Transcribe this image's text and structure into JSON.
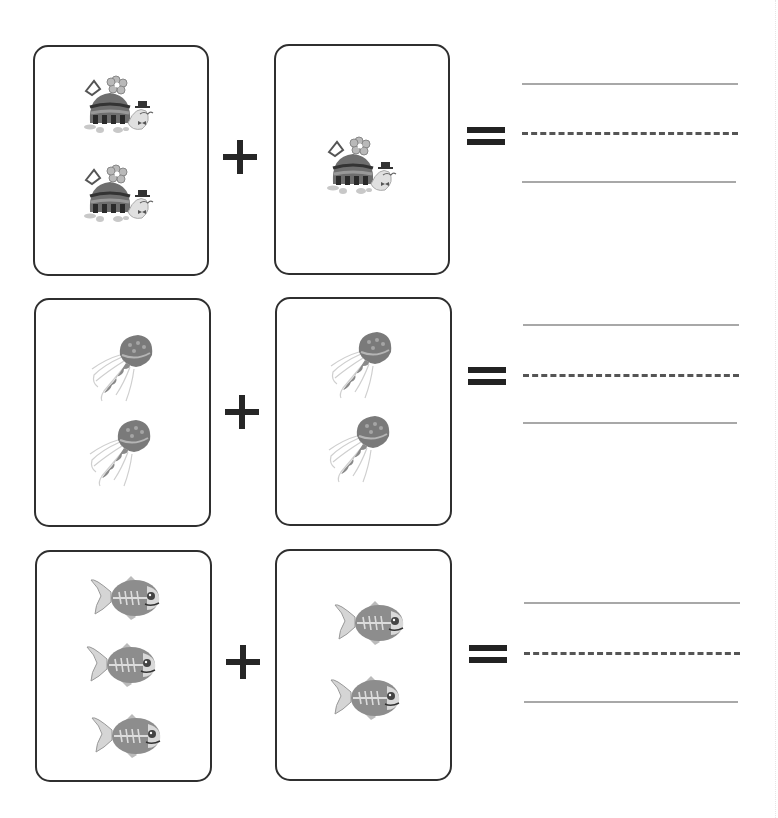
{
  "worksheet": {
    "type": "picture addition",
    "rows": [
      {
        "animal": "turtle",
        "left_count": 2,
        "right_count": 2,
        "left_card": {
          "x": 33,
          "y": 45,
          "w": 176,
          "h": 231,
          "items": 2
        },
        "right_card": {
          "x": 274,
          "y": 44,
          "w": 176,
          "h": 231,
          "items": 1
        },
        "operator": "+",
        "equals": "=",
        "answer_lines": {
          "top_y": 84,
          "mid_y": 133,
          "bottom_y": 182
        }
      },
      {
        "animal": "jellyfish",
        "left_count": 2,
        "right_count": 2,
        "left_card": {
          "x": 34,
          "y": 298,
          "w": 177,
          "h": 229,
          "items": 2
        },
        "right_card": {
          "x": 275,
          "y": 297,
          "w": 177,
          "h": 229,
          "items": 2
        },
        "operator": "+",
        "equals": "=",
        "answer_lines": {
          "top_y": 325,
          "mid_y": 375,
          "bottom_y": 423
        }
      },
      {
        "animal": "fish",
        "left_count": 3,
        "right_count": 2,
        "left_card": {
          "x": 35,
          "y": 550,
          "w": 177,
          "h": 232,
          "items": 3
        },
        "right_card": {
          "x": 275,
          "y": 549,
          "w": 177,
          "h": 232,
          "items": 2
        },
        "operator": "+",
        "equals": "=",
        "answer_lines": {
          "top_y": 603,
          "mid_y": 653,
          "bottom_y": 702
        }
      }
    ],
    "colors": {
      "card_border": "#2f2f2f",
      "operator": "#262626",
      "solid_line": "#a8a8a8",
      "dashed_line": "#555555"
    }
  }
}
